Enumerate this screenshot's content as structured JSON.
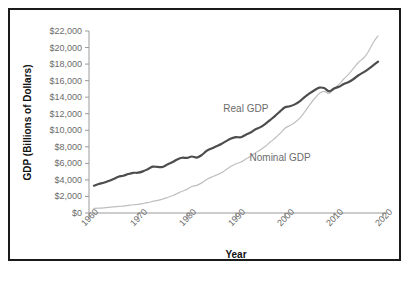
{
  "chart_data": {
    "type": "line",
    "title": "",
    "xlabel": "Year",
    "ylabel": "GDP (Billions of Dollars)",
    "xlim": [
      1960,
      2020
    ],
    "ylim": [
      0,
      22000
    ],
    "xticks": [
      "1960",
      "1970",
      "1980",
      "1990",
      "2000",
      "2010",
      "2020"
    ],
    "xtick_values": [
      1960,
      1970,
      1980,
      1990,
      2000,
      2010,
      2020
    ],
    "yticks": [
      "$0",
      "$2,000",
      "$4,000",
      "$6,000",
      "$8,000",
      "$10,000",
      "$12,000",
      "$14,000",
      "$16,000",
      "$18,000",
      "$20,000",
      "$22,000"
    ],
    "ytick_values": [
      0,
      2000,
      4000,
      6000,
      8000,
      10000,
      12000,
      14000,
      16000,
      18000,
      20000,
      22000
    ],
    "grid": false,
    "legend_position": "inline-annotations",
    "colors": {
      "real_gdp": "#4d4d4d",
      "nominal_gdp": "#bfbfbf",
      "axis": "#9a9a9a",
      "tick_text": "#6b6b6b",
      "axis_title": "#111111",
      "border": "#1a1a1a",
      "background": "#ffffff"
    },
    "series": [
      {
        "name": "Real GDP",
        "color": "#4d4d4d",
        "line_width": 2.2,
        "label_x": 1992,
        "label_y": 12600,
        "x": [
          1961,
          1962,
          1963,
          1964,
          1965,
          1966,
          1967,
          1968,
          1969,
          1970,
          1971,
          1972,
          1973,
          1974,
          1975,
          1976,
          1977,
          1978,
          1979,
          1980,
          1981,
          1982,
          1983,
          1984,
          1985,
          1986,
          1987,
          1988,
          1989,
          1990,
          1991,
          1992,
          1993,
          1994,
          1995,
          1996,
          1997,
          1998,
          1999,
          2000,
          2001,
          2002,
          2003,
          2004,
          2005,
          2006,
          2007,
          2008,
          2009,
          2010,
          2011,
          2012,
          2013,
          2014,
          2015,
          2016,
          2017,
          2018,
          2019
        ],
        "y": [
          3300,
          3500,
          3650,
          3860,
          4110,
          4380,
          4500,
          4710,
          4860,
          4870,
          5030,
          5300,
          5600,
          5570,
          5560,
          5860,
          6130,
          6470,
          6680,
          6660,
          6830,
          6700,
          7000,
          7500,
          7800,
          8070,
          8340,
          8690,
          9000,
          9170,
          9150,
          9470,
          9730,
          10130,
          10380,
          10780,
          11260,
          11750,
          12280,
          12780,
          12900,
          13130,
          13500,
          14010,
          14450,
          14840,
          15150,
          15100,
          14700,
          15050,
          15250,
          15600,
          15840,
          16200,
          16650,
          17000,
          17400,
          17850,
          18300
        ]
      },
      {
        "name": "Nominal GDP",
        "color": "#bfbfbf",
        "line_width": 1.2,
        "label_x": 1999,
        "label_y": 6700,
        "x": [
          1961,
          1962,
          1963,
          1964,
          1965,
          1966,
          1967,
          1968,
          1969,
          1970,
          1971,
          1972,
          1973,
          1974,
          1975,
          1976,
          1977,
          1978,
          1979,
          1980,
          1981,
          1982,
          1983,
          1984,
          1985,
          1986,
          1987,
          1988,
          1989,
          1990,
          1991,
          1992,
          1993,
          1994,
          1995,
          1996,
          1997,
          1998,
          1999,
          2000,
          2001,
          2002,
          2003,
          2004,
          2005,
          2006,
          2007,
          2008,
          2009,
          2010,
          2011,
          2012,
          2013,
          2014,
          2015,
          2016,
          2017,
          2018,
          2019
        ],
        "y": [
          550,
          580,
          620,
          670,
          730,
          800,
          840,
          920,
          1000,
          1050,
          1140,
          1250,
          1400,
          1530,
          1670,
          1870,
          2080,
          2350,
          2630,
          2860,
          3210,
          3340,
          3640,
          4040,
          4340,
          4580,
          4860,
          5250,
          5660,
          5960,
          6160,
          6520,
          6860,
          7290,
          7640,
          8070,
          8580,
          9060,
          9630,
          10250,
          10580,
          10930,
          11460,
          12210,
          13040,
          13810,
          14450,
          14710,
          14450,
          14990,
          15540,
          16200,
          16780,
          17520,
          18220,
          18710,
          19490,
          20580,
          21430
        ]
      }
    ]
  }
}
